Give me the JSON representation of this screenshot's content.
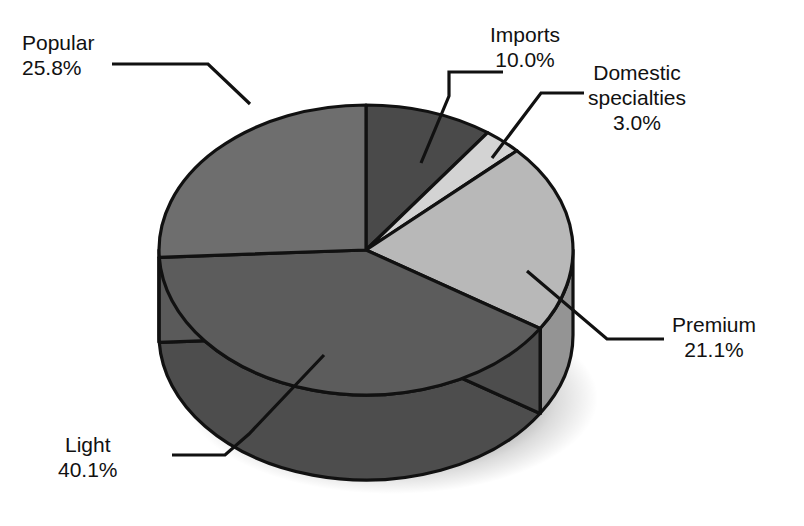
{
  "title_clipped": "Figure: Market share of beer by type, domestic and imported, United States",
  "chart_data": {
    "type": "pie",
    "title": "",
    "subtitle": "",
    "xlabel": "",
    "ylabel": "",
    "legend_position": "labels-with-leader-lines",
    "grid": false,
    "three_d": true,
    "start_angle_deg": 0,
    "direction": "clockwise",
    "total_percent": "100.0%",
    "categories": [
      "Imports",
      "Domestic specialties",
      "Premium",
      "Light",
      "Popular"
    ],
    "values": [
      10.0,
      3.0,
      21.1,
      40.1,
      25.8
    ],
    "value_labels": [
      "10.0%",
      "3.0%",
      "21.1%",
      "40.1%",
      "25.8%"
    ],
    "slices": [
      {
        "name": "Imports",
        "label_line1": "Imports",
        "label_line2": "10.0%",
        "value": 10.0,
        "value_label": "10.0%",
        "color": "#4a4a4a",
        "side_color": "#3a3a3a"
      },
      {
        "name": "Domestic specialties",
        "label_line1": "Domestic",
        "label_line2": "specialties",
        "label_line3": "3.0%",
        "value": 3.0,
        "value_label": "3.0%",
        "color": "#d3d3d3",
        "side_color": "#a8a8a8"
      },
      {
        "name": "Premium",
        "label_line1": "Premium",
        "label_line2": "21.1%",
        "value": 21.1,
        "value_label": "21.1%",
        "color": "#b8b8b8",
        "side_color": "#949494"
      },
      {
        "name": "Light",
        "label_line1": "Light",
        "label_line2": "40.1%",
        "value": 40.1,
        "value_label": "40.1%",
        "color": "#5c5c5c",
        "side_color": "#4d4d4d"
      },
      {
        "name": "Popular",
        "label_line1": "Popular",
        "label_line2": "25.8%",
        "value": 25.8,
        "value_label": "25.8%",
        "color": "#6e6e6e",
        "side_color": "#5a5a5a"
      }
    ]
  }
}
